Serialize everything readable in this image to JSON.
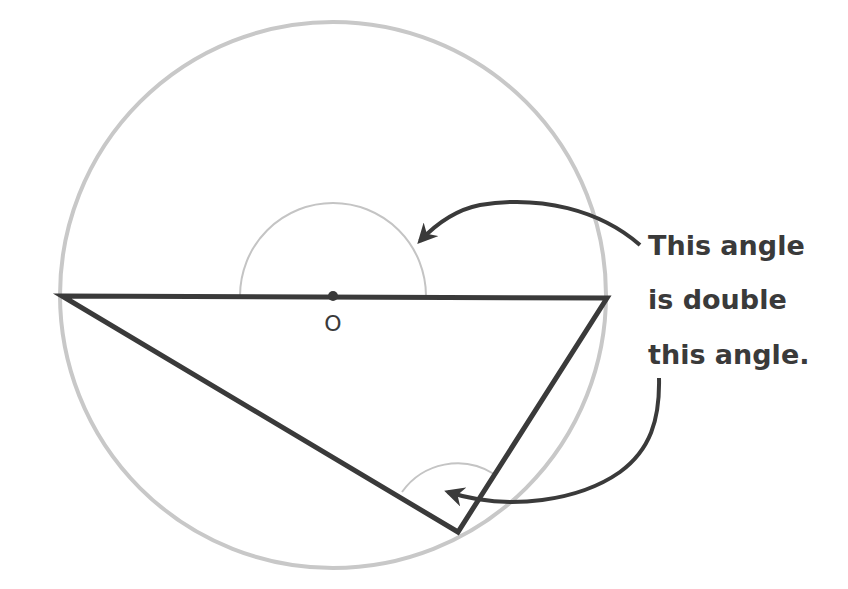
{
  "diagram": {
    "colors": {
      "circle": "#c8c8c8",
      "angle_arc": "#c4c4c4",
      "lines": "#3a3a3a",
      "text": "#3a3a3a",
      "background": "#ffffff"
    },
    "circle": {
      "cx": 333,
      "cy": 295,
      "r": 273
    },
    "center_point": {
      "label": "O",
      "x": 333,
      "y": 296
    },
    "triangle": {
      "vertices": [
        {
          "name": "left",
          "x": 62,
          "y": 296
        },
        {
          "name": "right",
          "x": 607,
          "y": 298
        },
        {
          "name": "bottom",
          "x": 458,
          "y": 532
        }
      ]
    },
    "annotation": {
      "lines": [
        "This angle",
        "is double",
        "this angle."
      ]
    }
  }
}
